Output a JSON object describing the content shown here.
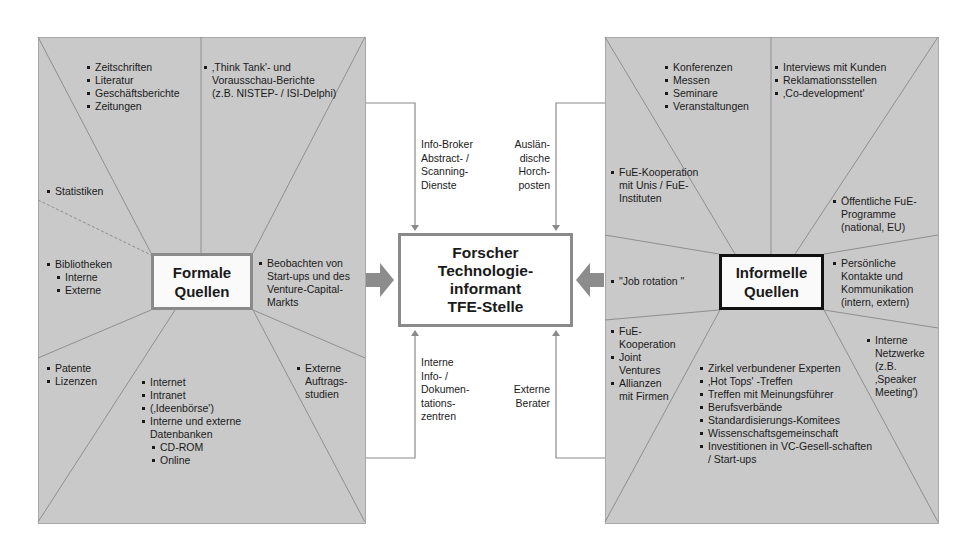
{
  "diagram": {
    "center": {
      "lines": [
        "Forscher",
        "Technologie-",
        "informant",
        "TFE-Stelle"
      ]
    },
    "formal": {
      "hub": [
        "Formale",
        "Quellen"
      ],
      "segments": {
        "top_left": [
          "Zeitschriften",
          "Literatur",
          "Geschäftsberichte",
          "Zeitungen"
        ],
        "top_right": [
          "‚Think Tank'- und Vorausschau-Berichte (z.B. NISTEP- / ISI-Delphi)"
        ],
        "left_upper": [
          "Statistiken"
        ],
        "left": {
          "item": "Bibliotheken",
          "sub": [
            "Interne",
            "Externe"
          ]
        },
        "right": [
          "Beobachten von Start-ups und des Venture-Capital-Markts"
        ],
        "bottom_left": [
          "Patente",
          "Lizenzen"
        ],
        "bottom": {
          "items": [
            "Internet",
            "Intranet",
            "(‚Ideenbörse')",
            "Interne und externe Datenbanken"
          ],
          "sub": [
            "CD-ROM",
            "Online"
          ]
        },
        "bottom_right": [
          "Externe Auftrags-studien"
        ]
      }
    },
    "informal": {
      "hub": [
        "Informelle",
        "Quellen"
      ],
      "segments": {
        "top_left": [
          "Konferenzen",
          "Messen",
          "Seminare",
          "Veranstaltungen"
        ],
        "top_right": [
          "Interviews mit Kunden",
          "Reklamationsstellen",
          "‚Co-development'"
        ],
        "left_upper": [
          "FuE-Kooperation mit Unis / FuE-Instituten"
        ],
        "right_upper": [
          "Öffentliche FuE-Programme (national, EU)"
        ],
        "left": [
          "\"Job rotation \""
        ],
        "right": [
          "Persönliche Kontakte und Kommunikation (intern, extern)"
        ],
        "bottom_left": [
          "FuE-Kooperation",
          "Joint Ventures",
          "Allianzen mit Firmen"
        ],
        "bottom": [
          "Zirkel verbundener Experten",
          "‚Hot Tops' -Treffen",
          "Treffen mit Meinungsführer",
          "Berufsverbände",
          "Standardisierungs-Komitees",
          "Wissenschaftsgemeinschaft",
          "Investitionen in VC-Gesell-schaften / Start-ups"
        ],
        "bottom_right": [
          "Interne Netzwerke (z.B. ‚Speaker Meeting')"
        ]
      }
    },
    "connectors": {
      "top_left": [
        "Info-Broker",
        "Abstract- /",
        "Scanning-",
        "Dienste"
      ],
      "top_right": [
        "Auslän-",
        "dische",
        "Horch-",
        "posten"
      ],
      "bottom_left": [
        "Interne",
        "Info- /",
        "Dokumen-",
        "tations-",
        "zentren"
      ],
      "bottom_right": [
        "Externe",
        "Berater"
      ]
    },
    "colors": {
      "panel": "#c9c9c9",
      "line": "#8a8a8a",
      "arrow": "#8c8c8c",
      "informal_border": "#111111"
    }
  }
}
